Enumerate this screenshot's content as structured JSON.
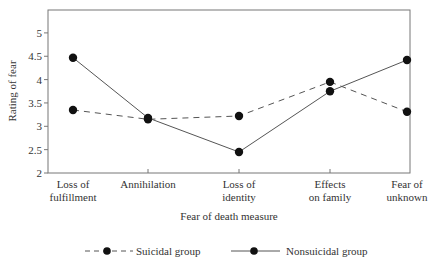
{
  "chart_data": {
    "type": "line",
    "title": "",
    "xlabel": "Fear of death measure",
    "ylabel": "Rating of fear",
    "ylim": [
      2,
      5.5
    ],
    "yticks": [
      "2",
      "2.5",
      "3",
      "3.5",
      "4",
      "4.5",
      "5"
    ],
    "categories": [
      [
        "Loss of",
        "fulfillment"
      ],
      [
        "Annihilation"
      ],
      [
        "Loss of",
        "identity"
      ],
      [
        "Effects",
        "on family"
      ],
      [
        "Fear of",
        "unknown"
      ]
    ],
    "series": [
      {
        "name": "Suicidal group",
        "style": "dashed",
        "values": [
          3.35,
          3.15,
          3.22,
          3.95,
          3.31
        ]
      },
      {
        "name": "Nonsuicidal group",
        "style": "solid",
        "values": [
          4.47,
          3.18,
          2.45,
          3.75,
          4.42
        ]
      }
    ],
    "grid": false,
    "legend_position": "bottom",
    "colors": {
      "line": "#555555",
      "marker": "#111111",
      "axis": "#777777"
    }
  }
}
